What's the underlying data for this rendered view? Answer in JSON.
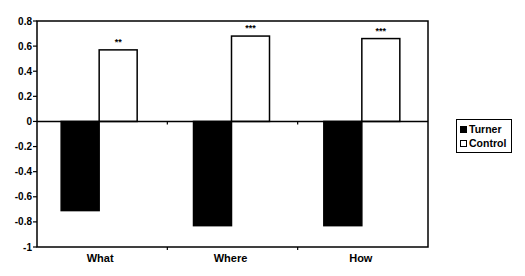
{
  "chart_data": {
    "type": "bar",
    "title": "",
    "xlabel": "",
    "ylabel": "",
    "categories": [
      "What",
      "Where",
      "How"
    ],
    "series": [
      {
        "name": "Turner",
        "color": "#000000",
        "values": [
          -0.71,
          -0.83,
          -0.83
        ]
      },
      {
        "name": "Control",
        "color": "#ffffff",
        "values": [
          0.57,
          0.68,
          0.66
        ]
      }
    ],
    "annotations": [
      {
        "category": "What",
        "series": "Control",
        "text": "**"
      },
      {
        "category": "Where",
        "series": "Control",
        "text": "***"
      },
      {
        "category": "How",
        "series": "Control",
        "text": "***"
      }
    ],
    "ylim": [
      -1,
      0.8
    ],
    "yticks": [
      0.8,
      0.6,
      0.4,
      0.2,
      0,
      -0.2,
      -0.4,
      -0.6,
      -0.8,
      -1
    ],
    "ytick_labels": [
      "0.8",
      "0.6",
      "0.4",
      "0.2",
      "0",
      "-0.2",
      "-0.4",
      "-0.6",
      "-0.8",
      "-1"
    ],
    "grid": false,
    "legend_position": "right"
  },
  "legend": {
    "items": [
      {
        "label": "Turner",
        "color": "#000000"
      },
      {
        "label": "Control",
        "color": "#ffffff"
      }
    ]
  }
}
